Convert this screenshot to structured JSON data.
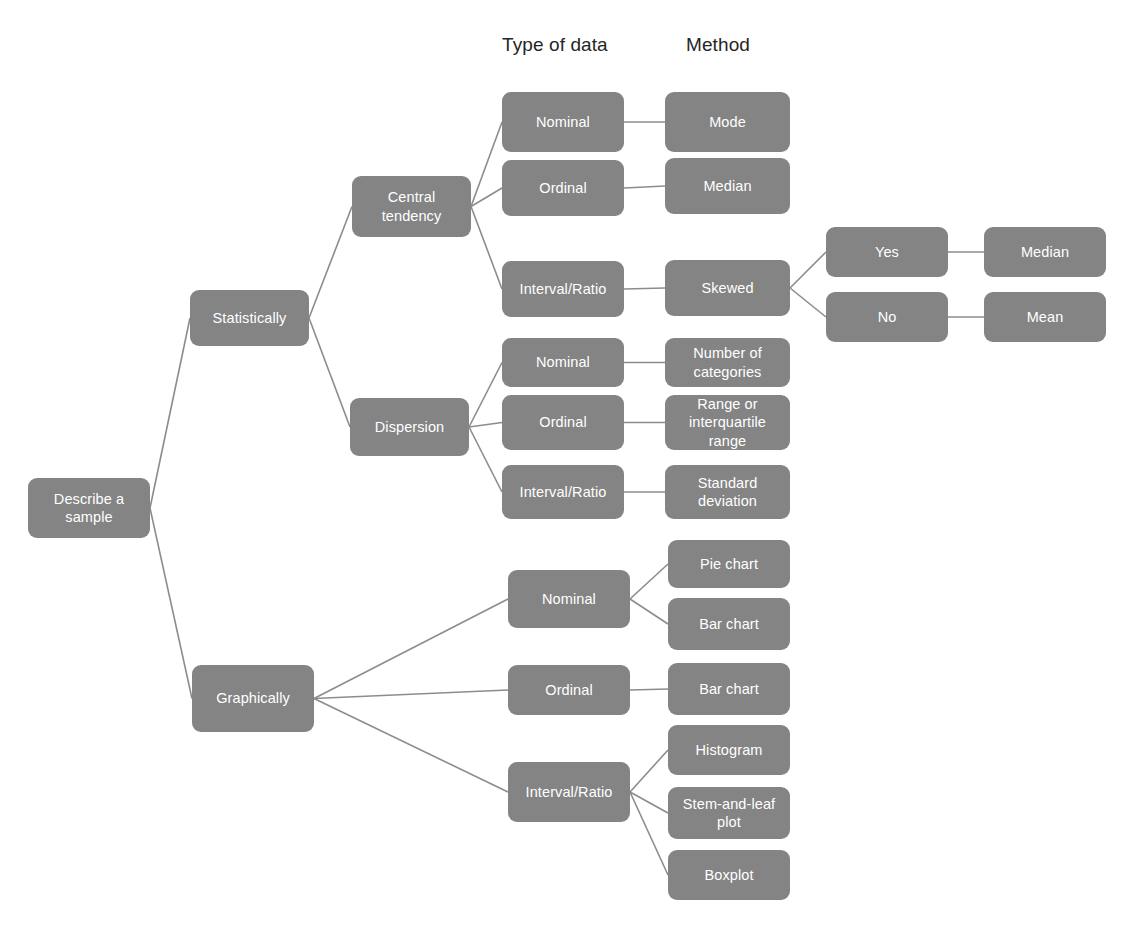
{
  "diagram": {
    "title": "Describe a sample",
    "type": "flowchart",
    "node_fill": "#848484",
    "node_text_color": "#ffffff",
    "edge_color": "#8c8c8c",
    "background": "#ffffff",
    "column_headers": [
      {
        "id": "hdr-type-of-data",
        "label": "Type of data",
        "x": 502,
        "y": 34
      },
      {
        "id": "hdr-method",
        "label": "Method",
        "x": 686,
        "y": 34
      }
    ],
    "nodes": [
      {
        "id": "root",
        "label": "Describe a\nsample",
        "x": 28,
        "y": 478,
        "w": 122,
        "h": 60
      },
      {
        "id": "statistically",
        "label": "Statistically",
        "x": 190,
        "y": 290,
        "w": 119,
        "h": 56
      },
      {
        "id": "graphically",
        "label": "Graphically",
        "x": 192,
        "y": 665,
        "w": 122,
        "h": 67
      },
      {
        "id": "central",
        "label": "Central\ntendency",
        "x": 352,
        "y": 176,
        "w": 119,
        "h": 61
      },
      {
        "id": "dispersion",
        "label": "Dispersion",
        "x": 350,
        "y": 398,
        "w": 119,
        "h": 58
      },
      {
        "id": "ct-nominal",
        "label": "Nominal",
        "x": 502,
        "y": 92,
        "w": 122,
        "h": 60
      },
      {
        "id": "ct-ordinal",
        "label": "Ordinal",
        "x": 502,
        "y": 160,
        "w": 122,
        "h": 56
      },
      {
        "id": "ct-interval",
        "label": "Interval/Ratio",
        "x": 502,
        "y": 261,
        "w": 122,
        "h": 56
      },
      {
        "id": "m-mode",
        "label": "Mode",
        "x": 665,
        "y": 92,
        "w": 125,
        "h": 60
      },
      {
        "id": "m-median",
        "label": "Median",
        "x": 665,
        "y": 158,
        "w": 125,
        "h": 56
      },
      {
        "id": "m-skewed",
        "label": "Skewed",
        "x": 665,
        "y": 260,
        "w": 125,
        "h": 56
      },
      {
        "id": "skew-yes",
        "label": "Yes",
        "x": 826,
        "y": 227,
        "w": 122,
        "h": 50
      },
      {
        "id": "skew-no",
        "label": "No",
        "x": 826,
        "y": 292,
        "w": 122,
        "h": 50
      },
      {
        "id": "skew-median",
        "label": "Median",
        "x": 984,
        "y": 227,
        "w": 122,
        "h": 50
      },
      {
        "id": "skew-mean",
        "label": "Mean",
        "x": 984,
        "y": 292,
        "w": 122,
        "h": 50
      },
      {
        "id": "d-nominal",
        "label": "Nominal",
        "x": 502,
        "y": 338,
        "w": 122,
        "h": 49
      },
      {
        "id": "d-ordinal",
        "label": "Ordinal",
        "x": 502,
        "y": 395,
        "w": 122,
        "h": 55
      },
      {
        "id": "d-interval",
        "label": "Interval/Ratio",
        "x": 502,
        "y": 465,
        "w": 122,
        "h": 54
      },
      {
        "id": "m-numcat",
        "label": "Number of\ncategories",
        "x": 665,
        "y": 338,
        "w": 125,
        "h": 49
      },
      {
        "id": "m-range",
        "label": "Range or\ninterquartile\nrange",
        "x": 665,
        "y": 395,
        "w": 125,
        "h": 55
      },
      {
        "id": "m-sd",
        "label": "Standard\ndeviation",
        "x": 665,
        "y": 465,
        "w": 125,
        "h": 54
      },
      {
        "id": "g-nominal",
        "label": "Nominal",
        "x": 508,
        "y": 570,
        "w": 122,
        "h": 58
      },
      {
        "id": "g-ordinal",
        "label": "Ordinal",
        "x": 508,
        "y": 665,
        "w": 122,
        "h": 50
      },
      {
        "id": "g-interval",
        "label": "Interval/Ratio",
        "x": 508,
        "y": 762,
        "w": 122,
        "h": 60
      },
      {
        "id": "m-pie",
        "label": "Pie chart",
        "x": 668,
        "y": 540,
        "w": 122,
        "h": 48
      },
      {
        "id": "m-barchart1",
        "label": "Bar chart",
        "x": 668,
        "y": 598,
        "w": 122,
        "h": 52
      },
      {
        "id": "m-barchart2",
        "label": "Bar chart",
        "x": 668,
        "y": 663,
        "w": 122,
        "h": 52
      },
      {
        "id": "m-histogram",
        "label": "Histogram",
        "x": 668,
        "y": 725,
        "w": 122,
        "h": 50
      },
      {
        "id": "m-stemleaf",
        "label": "Stem-and-leaf\nplot",
        "x": 668,
        "y": 787,
        "w": 122,
        "h": 52
      },
      {
        "id": "m-boxplot",
        "label": "Boxplot",
        "x": 668,
        "y": 850,
        "w": 122,
        "h": 50
      }
    ],
    "edges": [
      {
        "from": "root",
        "to": "statistically"
      },
      {
        "from": "root",
        "to": "graphically"
      },
      {
        "from": "statistically",
        "to": "central"
      },
      {
        "from": "statistically",
        "to": "dispersion"
      },
      {
        "from": "central",
        "to": "ct-nominal"
      },
      {
        "from": "central",
        "to": "ct-ordinal"
      },
      {
        "from": "central",
        "to": "ct-interval"
      },
      {
        "from": "ct-nominal",
        "to": "m-mode"
      },
      {
        "from": "ct-ordinal",
        "to": "m-median"
      },
      {
        "from": "ct-interval",
        "to": "m-skewed"
      },
      {
        "from": "m-skewed",
        "to": "skew-yes"
      },
      {
        "from": "m-skewed",
        "to": "skew-no"
      },
      {
        "from": "skew-yes",
        "to": "skew-median"
      },
      {
        "from": "skew-no",
        "to": "skew-mean"
      },
      {
        "from": "dispersion",
        "to": "d-nominal"
      },
      {
        "from": "dispersion",
        "to": "d-ordinal"
      },
      {
        "from": "dispersion",
        "to": "d-interval"
      },
      {
        "from": "d-nominal",
        "to": "m-numcat"
      },
      {
        "from": "d-ordinal",
        "to": "m-range"
      },
      {
        "from": "d-interval",
        "to": "m-sd"
      },
      {
        "from": "graphically",
        "to": "g-nominal"
      },
      {
        "from": "graphically",
        "to": "g-ordinal"
      },
      {
        "from": "graphically",
        "to": "g-interval"
      },
      {
        "from": "g-nominal",
        "to": "m-pie"
      },
      {
        "from": "g-nominal",
        "to": "m-barchart1"
      },
      {
        "from": "g-ordinal",
        "to": "m-barchart2"
      },
      {
        "from": "g-interval",
        "to": "m-histogram"
      },
      {
        "from": "g-interval",
        "to": "m-stemleaf"
      },
      {
        "from": "g-interval",
        "to": "m-boxplot"
      }
    ]
  }
}
